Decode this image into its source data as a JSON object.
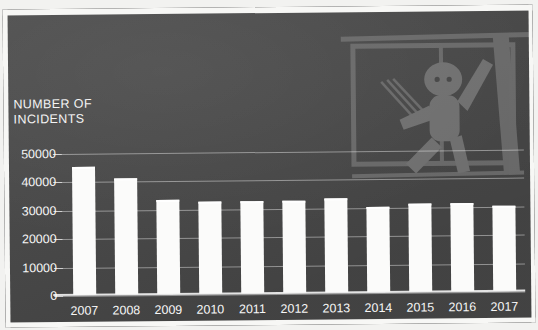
{
  "chart_data": {
    "type": "bar",
    "title": "",
    "ylabel": "NUMBER OF INCIDENTS",
    "xlabel": "",
    "categories": [
      "2007",
      "2008",
      "2009",
      "2010",
      "2011",
      "2012",
      "2013",
      "2014",
      "2015",
      "2016",
      "2017"
    ],
    "values": [
      45000,
      41000,
      33000,
      32500,
      32500,
      32500,
      33000,
      30000,
      31000,
      31000,
      30000
    ],
    "ylim": [
      0,
      50000
    ],
    "ytick_labels": [
      "50000",
      "40000",
      "30000",
      "20000",
      "10000",
      "0"
    ],
    "ytick_values": [
      50000,
      40000,
      30000,
      20000,
      10000,
      0
    ],
    "grid": true,
    "legend": "none",
    "bar_color": "#fbfbfa",
    "background_color": "#4a4a4a",
    "text_color": "#f6f6f6"
  },
  "axis": {
    "y_title_line1": "NUMBER OF",
    "y_title_line2": "INCIDENTS"
  },
  "illustration": {
    "name": "child-climbing-out-of-window"
  }
}
